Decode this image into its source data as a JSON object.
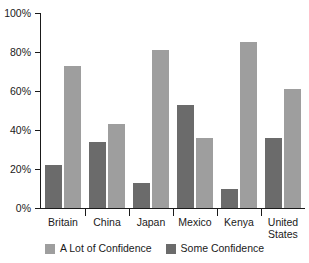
{
  "chart_data": {
    "type": "bar",
    "title": "",
    "subtitle": "",
    "xlabel": "",
    "ylabel": "",
    "ylim": [
      0,
      100
    ],
    "yticks": [
      0,
      20,
      40,
      60,
      80,
      100
    ],
    "ytick_labels": [
      "0%",
      "20%",
      "40%",
      "60%",
      "80%",
      "100%"
    ],
    "grid": false,
    "legend_position": "bottom-center",
    "categories": [
      "Britain",
      "China",
      "Japan",
      "Mexico",
      "Kenya",
      "United States"
    ],
    "series": [
      {
        "name": "Some Confidence",
        "color": "#6b6b6b",
        "values": [
          22,
          34,
          13,
          53,
          10,
          36
        ]
      },
      {
        "name": "A Lot of Confidence",
        "color": "#9e9e9e",
        "values": [
          73,
          43,
          81,
          36,
          85,
          61
        ]
      }
    ],
    "legend": [
      {
        "label": "A Lot of Confidence",
        "color": "#9e9e9e"
      },
      {
        "label": "Some Confidence",
        "color": "#6b6b6b"
      }
    ]
  },
  "colors": {
    "a_lot_of_confidence": "#9e9e9e",
    "some_confidence": "#6b6b6b",
    "axis": "#1a1a1a",
    "background": "#ffffff"
  }
}
